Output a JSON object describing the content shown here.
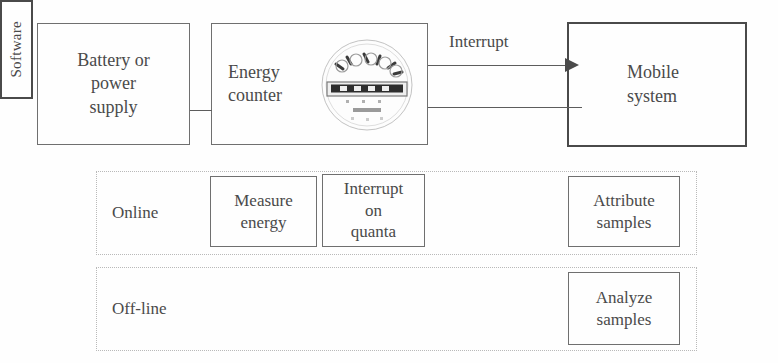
{
  "diagram": {
    "top_row": {
      "battery": {
        "label": "Battery or\npower\nsupply"
      },
      "energy_counter": {
        "label": "Energy\ncounter",
        "icon": "energy-meter-icon"
      },
      "interrupt_arrow": {
        "label": "Interrupt"
      },
      "mobile_system": {
        "label": "Mobile\nsystem"
      },
      "software": {
        "label": "Software"
      }
    },
    "lanes": [
      {
        "title": "Online",
        "boxes": [
          {
            "label": "Measure\nenergy"
          },
          {
            "label": "Interrupt\non\nquanta"
          },
          {
            "label": "Attribute\nsamples"
          }
        ]
      },
      {
        "title": "Off-line",
        "boxes": [
          {
            "label": "Analyze\nsamples"
          }
        ]
      }
    ]
  },
  "colors": {
    "background": "#fefefe",
    "box_stroke": "#6f6f6f",
    "heavy_stroke": "#4a4a4a",
    "lane_stroke": "#b9b9b9",
    "text": "#4a4a4a"
  }
}
